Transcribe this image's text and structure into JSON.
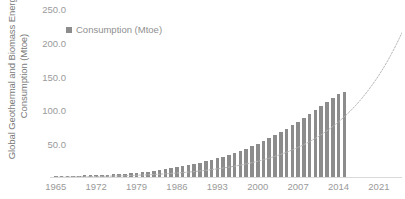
{
  "chart_data": {
    "type": "bar",
    "title": "",
    "xlabel": "",
    "ylabel": "Global Geothermal and Biomass Energy Consumption (Mtoe)",
    "ylabel_lines": [
      "Global Geothermal and Biomass Energy",
      "Consumption (Mtoe)"
    ],
    "ylim": [
      0,
      250
    ],
    "ytick_labels": [
      "250.0",
      "200.0",
      "150.0",
      "100.0",
      "50.0"
    ],
    "ytick_values": [
      250,
      200,
      150,
      100,
      50
    ],
    "xtick_labels": [
      "1965",
      "1972",
      "1979",
      "1986",
      "1993",
      "2000",
      "2007",
      "2014",
      "2021"
    ],
    "xtick_values": [
      1965,
      1972,
      1979,
      1986,
      1993,
      2000,
      2007,
      2014,
      2021
    ],
    "xlim": [
      1964,
      2025
    ],
    "grid": false,
    "legend_position": "top-left",
    "legend": [
      {
        "name": "Consumption (Mtoe)",
        "color": "#8c8c8c",
        "marker": "square"
      }
    ],
    "series": [
      {
        "name": "Consumption (Mtoe)",
        "color": "#8c8c8c",
        "x": [
          1965,
          1966,
          1967,
          1968,
          1969,
          1970,
          1971,
          1972,
          1973,
          1974,
          1975,
          1976,
          1977,
          1978,
          1979,
          1980,
          1981,
          1982,
          1983,
          1984,
          1985,
          1986,
          1987,
          1988,
          1989,
          1990,
          1991,
          1992,
          1993,
          1994,
          1995,
          1996,
          1997,
          1998,
          1999,
          2000,
          2001,
          2002,
          2003,
          2004,
          2005,
          2006,
          2007,
          2008,
          2009,
          2010,
          2011,
          2012,
          2013,
          2014,
          2015
        ],
        "values": [
          1.2,
          1.4,
          1.6,
          1.8,
          2.0,
          2.3,
          2.6,
          2.9,
          3.3,
          3.7,
          4.1,
          4.6,
          5.1,
          5.6,
          6.2,
          7.0,
          8.0,
          9.0,
          10.2,
          11.5,
          13.0,
          14.5,
          16.0,
          17.6,
          19.2,
          21.0,
          23.0,
          25.0,
          27.5,
          30.0,
          33.0,
          36.0,
          39.0,
          42.0,
          45.5,
          49.0,
          53.0,
          57.0,
          61.5,
          66.0,
          71.0,
          76.5,
          82.0,
          88.0,
          93.0,
          99.0,
          105.0,
          111.0,
          117.0,
          123.0,
          126.0
        ]
      }
    ],
    "trendline": {
      "style": "dotted",
      "color": "#b5b5b5",
      "extends_beyond_data": true,
      "start_year": 1965,
      "end_year": 2025,
      "end_value": 215
    }
  },
  "legend": {
    "consumption_label": "Consumption (Mtoe)"
  },
  "axis": {
    "y_title_line1": "Global Geothermal and Biomass Energy",
    "y_title_line2": "Consumption (Mtoe)"
  }
}
